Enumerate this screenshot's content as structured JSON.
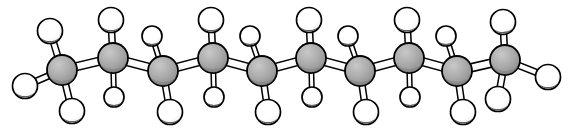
{
  "figure": {
    "name": "ball-and-stick-molecular-model",
    "molecule": "decane",
    "formula": "C10H22",
    "background_color": "#ffffff",
    "width": 575,
    "height": 133,
    "labels": [],
    "caption": ""
  },
  "style": {
    "carbon_fill": "#a9a9a9",
    "carbon_fill_shade": "#8c8c8c",
    "carbon_highlight": "#c8c8c8",
    "hydrogen_fill": "#ffffff",
    "hydrogen_shade": "#4a4a4a",
    "bond_fill": "#ffffff",
    "outline_color": "#000000",
    "outline_width": 1.8,
    "carbon_radius": 15,
    "hydrogen_radius_front": 12.5,
    "hydrogen_radius_back": 10,
    "bond_width_cc": 8,
    "bond_width_ch_front": 6,
    "bond_width_ch_back": 4.5
  },
  "atoms": {
    "carbon_label": "C",
    "hydrogen_label": "H",
    "carbons": [
      {
        "id": "C1",
        "element": "C",
        "x": 62,
        "y": 70,
        "r": 15
      },
      {
        "id": "C2",
        "element": "C",
        "x": 113,
        "y": 58,
        "r": 15
      },
      {
        "id": "C3",
        "element": "C",
        "x": 163,
        "y": 71,
        "r": 15
      },
      {
        "id": "C4",
        "element": "C",
        "x": 213,
        "y": 58,
        "r": 15
      },
      {
        "id": "C5",
        "element": "C",
        "x": 262,
        "y": 71,
        "r": 15
      },
      {
        "id": "C6",
        "element": "C",
        "x": 311,
        "y": 58,
        "r": 15
      },
      {
        "id": "C7",
        "element": "C",
        "x": 360,
        "y": 71,
        "r": 15
      },
      {
        "id": "C8",
        "element": "C",
        "x": 409,
        "y": 58,
        "r": 15
      },
      {
        "id": "C9",
        "element": "C",
        "x": 457,
        "y": 71,
        "r": 15
      },
      {
        "id": "C10",
        "element": "C",
        "x": 505,
        "y": 60,
        "r": 15
      }
    ],
    "hydrogens": [
      {
        "id": "H1",
        "element": "H",
        "x": 50,
        "y": 31,
        "r": 12.5,
        "bond": "front",
        "on": "C1"
      },
      {
        "id": "H2",
        "element": "H",
        "x": 25,
        "y": 86,
        "r": 12.5,
        "bond": "front",
        "on": "C1"
      },
      {
        "id": "H3",
        "element": "H",
        "x": 72,
        "y": 111,
        "r": 12.5,
        "bond": "front",
        "on": "C1"
      },
      {
        "id": "H4",
        "element": "H",
        "x": 111,
        "y": 20,
        "r": 12.5,
        "bond": "front",
        "on": "C2"
      },
      {
        "id": "H5",
        "element": "H",
        "x": 114,
        "y": 97,
        "r": 10,
        "bond": "back",
        "on": "C2"
      },
      {
        "id": "H6",
        "element": "H",
        "x": 152,
        "y": 36,
        "r": 10,
        "bond": "back",
        "on": "C3"
      },
      {
        "id": "H7",
        "element": "H",
        "x": 170,
        "y": 112,
        "r": 12.5,
        "bond": "front",
        "on": "C3"
      },
      {
        "id": "H8",
        "element": "H",
        "x": 211,
        "y": 20,
        "r": 12.5,
        "bond": "front",
        "on": "C4"
      },
      {
        "id": "H9",
        "element": "H",
        "x": 214,
        "y": 97,
        "r": 10,
        "bond": "back",
        "on": "C4"
      },
      {
        "id": "H10",
        "element": "H",
        "x": 250,
        "y": 36,
        "r": 10,
        "bond": "back",
        "on": "C5"
      },
      {
        "id": "H11",
        "element": "H",
        "x": 268,
        "y": 112,
        "r": 12.5,
        "bond": "front",
        "on": "C5"
      },
      {
        "id": "H12",
        "element": "H",
        "x": 309,
        "y": 20,
        "r": 12.5,
        "bond": "front",
        "on": "C6"
      },
      {
        "id": "H13",
        "element": "H",
        "x": 312,
        "y": 97,
        "r": 10,
        "bond": "back",
        "on": "C6"
      },
      {
        "id": "H14",
        "element": "H",
        "x": 348,
        "y": 36,
        "r": 10,
        "bond": "back",
        "on": "C7"
      },
      {
        "id": "H15",
        "element": "H",
        "x": 366,
        "y": 112,
        "r": 12.5,
        "bond": "front",
        "on": "C7"
      },
      {
        "id": "H16",
        "element": "H",
        "x": 407,
        "y": 20,
        "r": 12.5,
        "bond": "front",
        "on": "C8"
      },
      {
        "id": "H17",
        "element": "H",
        "x": 410,
        "y": 97,
        "r": 10,
        "bond": "back",
        "on": "C8"
      },
      {
        "id": "H18",
        "element": "H",
        "x": 446,
        "y": 36,
        "r": 10,
        "bond": "back",
        "on": "C9"
      },
      {
        "id": "H19",
        "element": "H",
        "x": 463,
        "y": 112,
        "r": 12.5,
        "bond": "front",
        "on": "C9"
      },
      {
        "id": "H20",
        "element": "H",
        "x": 503,
        "y": 22,
        "r": 12.5,
        "bond": "front",
        "on": "C10"
      },
      {
        "id": "H21",
        "element": "H",
        "x": 498,
        "y": 99,
        "r": 12.5,
        "bond": "front",
        "on": "C10"
      },
      {
        "id": "H22",
        "element": "H",
        "x": 548,
        "y": 77,
        "r": 12.5,
        "bond": "front",
        "on": "C10"
      }
    ]
  },
  "bonds": {
    "carbon_carbon": [
      {
        "from": "C1",
        "to": "C2"
      },
      {
        "from": "C2",
        "to": "C3"
      },
      {
        "from": "C3",
        "to": "C4"
      },
      {
        "from": "C4",
        "to": "C5"
      },
      {
        "from": "C5",
        "to": "C6"
      },
      {
        "from": "C6",
        "to": "C7"
      },
      {
        "from": "C7",
        "to": "C8"
      },
      {
        "from": "C8",
        "to": "C9"
      },
      {
        "from": "C9",
        "to": "C10"
      }
    ],
    "carbon_hydrogen": [
      {
        "from": "C1",
        "to": "H1"
      },
      {
        "from": "C1",
        "to": "H2"
      },
      {
        "from": "C1",
        "to": "H3"
      },
      {
        "from": "C2",
        "to": "H4"
      },
      {
        "from": "C2",
        "to": "H5"
      },
      {
        "from": "C3",
        "to": "H6"
      },
      {
        "from": "C3",
        "to": "H7"
      },
      {
        "from": "C4",
        "to": "H8"
      },
      {
        "from": "C4",
        "to": "H9"
      },
      {
        "from": "C5",
        "to": "H10"
      },
      {
        "from": "C5",
        "to": "H11"
      },
      {
        "from": "C6",
        "to": "H12"
      },
      {
        "from": "C6",
        "to": "H13"
      },
      {
        "from": "C7",
        "to": "H14"
      },
      {
        "from": "C7",
        "to": "H15"
      },
      {
        "from": "C8",
        "to": "H16"
      },
      {
        "from": "C8",
        "to": "H17"
      },
      {
        "from": "C9",
        "to": "H18"
      },
      {
        "from": "C9",
        "to": "H19"
      },
      {
        "from": "C10",
        "to": "H20"
      },
      {
        "from": "C10",
        "to": "H21"
      },
      {
        "from": "C10",
        "to": "H22"
      }
    ]
  }
}
